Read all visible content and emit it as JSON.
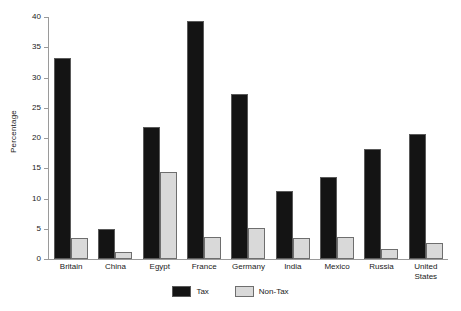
{
  "chart_data": {
    "type": "bar",
    "title": "",
    "xlabel": "",
    "ylabel": "Percentage",
    "ylim": [
      0,
      40
    ],
    "yticks": [
      0,
      5,
      10,
      15,
      20,
      25,
      30,
      35,
      40
    ],
    "grid": false,
    "legend_position": "bottom-center",
    "categories": [
      "Britain",
      "China",
      "Egypt",
      "France",
      "Germany",
      "India",
      "Mexico",
      "Russia",
      "United States"
    ],
    "series": [
      {
        "name": "Tax",
        "color": "#141414",
        "values": [
          33.2,
          5.0,
          21.8,
          39.3,
          27.2,
          11.3,
          13.6,
          18.2,
          20.6
        ]
      },
      {
        "name": "Non-Tax",
        "color": "#d9d9d9",
        "values": [
          3.5,
          1.2,
          14.4,
          3.6,
          5.1,
          3.5,
          3.6,
          1.7,
          2.7
        ]
      }
    ]
  },
  "legend": {
    "items": [
      {
        "label": "Tax",
        "swatch": "tax"
      },
      {
        "label": "Non-Tax",
        "swatch": "nontax"
      }
    ]
  }
}
